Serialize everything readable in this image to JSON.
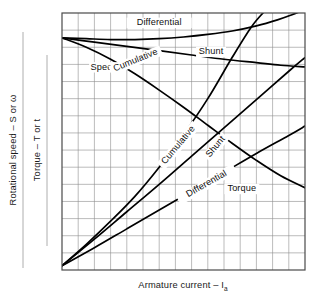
{
  "figure": {
    "background_color": "#ffffff",
    "frame_color": "#4a4a4a",
    "grid_color": "#8d8d8d",
    "curve_color": "#000000",
    "separator_rule_color": "#9a9a9a"
  },
  "axes": {
    "y_left_outer": "Rotational speed – S or ω",
    "y_left_inner": "Torque – T or t",
    "x_bottom_main": "Armature current – I",
    "x_bottom_subscript": "a"
  },
  "labels": {
    "speed_group": "Speed",
    "torque_group": "Torque",
    "speed_differential": "Differential",
    "speed_shunt": "Shunt",
    "speed_cumulative": "Cumulative",
    "torque_cumulative": "Cumulative",
    "torque_shunt": "Shunt",
    "torque_differential": "Differential"
  },
  "chart_data": {
    "type": "line",
    "title": "",
    "subtitle": "",
    "xlabel": "Armature current – I_a",
    "ylabel": "Rotational speed – S or ω ; Torque – T or t",
    "grid": true,
    "legend": "inline-annotations",
    "xlim": [
      0,
      15
    ],
    "ylim": [
      0,
      15
    ],
    "x_ticks": [
      0,
      1,
      2,
      3,
      4,
      5,
      6,
      7,
      8,
      9,
      10,
      11,
      12,
      13,
      14,
      15
    ],
    "y_ticks": [
      0,
      1,
      2,
      3,
      4,
      5,
      6,
      7,
      8,
      9,
      10,
      11,
      12,
      13,
      14,
      15
    ],
    "x_tick_labels": [],
    "y_tick_labels": [],
    "annotations": [
      {
        "text": "Speed",
        "x": 2.6,
        "y": 11.7,
        "rotation": 0
      },
      {
        "text": "Torque",
        "x": 11.1,
        "y": 4.6,
        "rotation": 0
      },
      {
        "text": "Differential",
        "x": 6.0,
        "y": 14.3,
        "rotation": 0
      },
      {
        "text": "Shunt",
        "x": 9.2,
        "y": 12.6,
        "rotation": 0
      },
      {
        "text": "Cumulative",
        "x": 4.6,
        "y": 12.1,
        "rotation": -22
      },
      {
        "text": "Cumulative",
        "x": 7.3,
        "y": 7.2,
        "rotation": -50
      },
      {
        "text": "Shunt",
        "x": 9.6,
        "y": 7.1,
        "rotation": -50
      },
      {
        "text": "Differential",
        "x": 9.0,
        "y": 4.9,
        "rotation": -30
      }
    ],
    "series": [
      {
        "name": "Speed – Differential",
        "group": "speed",
        "x": [
          0.0,
          1.5,
          3.0,
          4.5,
          6.0,
          7.5,
          9.0,
          10.5,
          12.0,
          13.3,
          14.2,
          15.0
        ],
        "y": [
          13.55,
          13.5,
          13.45,
          13.45,
          13.5,
          13.6,
          13.75,
          13.95,
          14.25,
          14.6,
          14.9,
          15.2
        ]
      },
      {
        "name": "Speed – Shunt",
        "group": "speed",
        "x": [
          0.0,
          2.0,
          4.0,
          6.0,
          8.0,
          10.0,
          12.0,
          13.5,
          15.0
        ],
        "y": [
          13.55,
          13.3,
          13.05,
          12.8,
          12.55,
          12.3,
          12.1,
          11.95,
          11.85
        ]
      },
      {
        "name": "Speed – Cumulative",
        "group": "speed",
        "x": [
          0.0,
          1.5,
          3.0,
          4.5,
          6.0,
          7.5,
          9.0,
          10.5,
          12.0,
          13.5,
          15.0
        ],
        "y": [
          13.55,
          13.0,
          12.3,
          11.45,
          10.5,
          9.5,
          8.45,
          7.4,
          6.4,
          5.5,
          4.8
        ]
      },
      {
        "name": "Torque – Cumulative",
        "group": "torque",
        "x": [
          0.0,
          1.5,
          3.0,
          4.5,
          6.0,
          7.5,
          9.0,
          10.5,
          11.7,
          12.6
        ],
        "y": [
          0.25,
          1.5,
          2.85,
          4.3,
          6.0,
          7.9,
          10.0,
          12.4,
          14.2,
          15.2
        ]
      },
      {
        "name": "Torque – Shunt",
        "group": "torque",
        "x": [
          0.0,
          2.0,
          4.0,
          6.0,
          8.0,
          10.0,
          12.0,
          14.0,
          15.0
        ],
        "y": [
          0.25,
          1.8,
          3.4,
          5.0,
          6.65,
          8.3,
          9.95,
          11.6,
          12.4
        ]
      },
      {
        "name": "Torque – Differential",
        "group": "torque",
        "x": [
          0.0,
          2.0,
          4.0,
          6.0,
          8.0,
          10.0,
          12.0,
          14.0,
          15.0
        ],
        "y": [
          0.25,
          1.3,
          2.4,
          3.5,
          4.6,
          5.7,
          6.8,
          7.85,
          8.4
        ]
      }
    ]
  }
}
